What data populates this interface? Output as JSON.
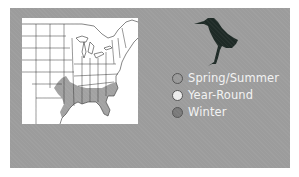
{
  "map": {
    "region": "Eastern United States",
    "range_shading_color": "#a0a0a0",
    "state_line_color": "#333333",
    "background": "#ffffff"
  },
  "panel": {
    "background": "#9c9c9c"
  },
  "bird": {
    "icon": "heron-silhouette-icon",
    "color": "#1e2a26"
  },
  "legend": {
    "items": [
      {
        "label": "Spring/Summer",
        "color": "#9a9a9a"
      },
      {
        "label": "Year-Round",
        "color": "#ececec"
      },
      {
        "label": "Winter",
        "color": "#7a7a7a"
      }
    ]
  }
}
